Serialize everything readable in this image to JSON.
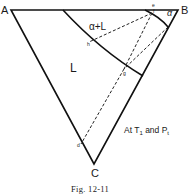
{
  "diagram": {
    "vertices": {
      "A": "A",
      "B": "B",
      "C": "C"
    },
    "regions": {
      "liquid": "L",
      "two_phase": "α+L",
      "solid": "α"
    },
    "points": {
      "e": "e",
      "f": "f",
      "h": "h",
      "g": "g",
      "d": "d"
    },
    "condition": "At T",
    "condition_sub1": "1",
    "condition_and": " and P",
    "condition_sub2": "t",
    "caption": "Fig. 12-11"
  }
}
